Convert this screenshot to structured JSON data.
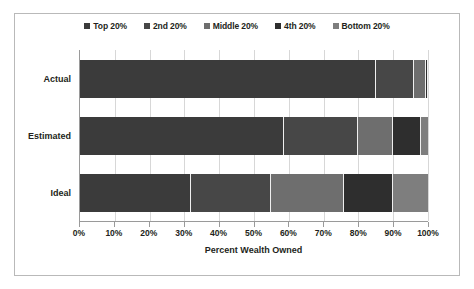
{
  "chart_data": {
    "type": "bar",
    "orientation": "horizontal",
    "stacked": true,
    "title": "",
    "xlabel": "Percent Wealth Owned",
    "ylabel": "",
    "xlim": [
      0,
      100
    ],
    "grid": true,
    "legend_position": "top",
    "categories": [
      "Actual",
      "Estimated",
      "Ideal"
    ],
    "tick_labels": [
      "0%",
      "10%",
      "20%",
      "30%",
      "40%",
      "50%",
      "60%",
      "70%",
      "80%",
      "90%",
      "100%"
    ],
    "tick_values": [
      0,
      10,
      20,
      30,
      40,
      50,
      60,
      70,
      80,
      90,
      100
    ],
    "series": [
      {
        "name": "Top 20%",
        "color": "#3b3b3b",
        "values": [
          85.0,
          58.5,
          32.0
        ]
      },
      {
        "name": "2nd 20%",
        "color": "#474747",
        "values": [
          11.0,
          21.5,
          23.0
        ]
      },
      {
        "name": "Middle 20%",
        "color": "#6e6e6e",
        "values": [
          3.5,
          10.0,
          21.0
        ]
      },
      {
        "name": "4th 20%",
        "color": "#2e2e2e",
        "values": [
          0.4,
          8.0,
          14.0
        ]
      },
      {
        "name": "Bottom 20%",
        "color": "#7e7e7e",
        "values": [
          0.1,
          2.0,
          10.0
        ]
      }
    ]
  },
  "legend": {
    "items": [
      {
        "label": "Top 20%",
        "color": "#3b3b3b"
      },
      {
        "label": "2nd 20%",
        "color": "#474747"
      },
      {
        "label": "Middle 20%",
        "color": "#6e6e6e"
      },
      {
        "label": "4th 20%",
        "color": "#2e2e2e"
      },
      {
        "label": "Bottom 20%",
        "color": "#7e7e7e"
      }
    ]
  },
  "axis": {
    "x_title": "Percent Wealth Owned"
  },
  "colors": {
    "frame_border": "#b9b9b9",
    "axis_line": "#9a9a9a",
    "gridline": "#d7d7d7",
    "text": "#231f20",
    "background": "#ffffff"
  }
}
